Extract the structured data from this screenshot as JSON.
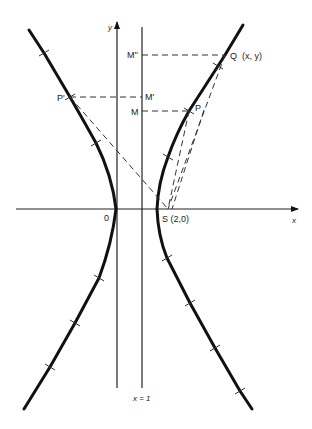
{
  "diagram": {
    "type": "hyperbola-focus-directrix",
    "colors": {
      "ink": "#111111",
      "dash": "#333333",
      "background": "#ffffff"
    },
    "axes": {
      "x_label": "x",
      "y_label": "y",
      "origin_label": "0"
    },
    "directrix": {
      "label": "x = 1"
    },
    "focus": {
      "label": "S (2,0)",
      "x": 2,
      "y": 0
    },
    "points": {
      "Q": {
        "label": "Q  (x, y)"
      },
      "P": {
        "label": "P"
      },
      "P_prime": {
        "label": "P'"
      },
      "M": {
        "label": "M"
      },
      "M_prime": {
        "label": "M'"
      },
      "M_double_prime": {
        "label": "M''"
      }
    },
    "curve": {
      "name": "hyperbola",
      "branches": [
        "left",
        "right"
      ]
    }
  }
}
